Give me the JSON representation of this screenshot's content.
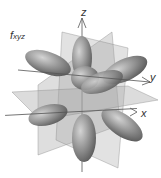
{
  "diagram": {
    "orbital_label": "f",
    "orbital_subscript": "xyz",
    "axes": {
      "x": "x",
      "y": "y",
      "z": "z"
    },
    "colors": {
      "lobe": "#8c8c8c",
      "lobe_highlight": "#c8c8c8",
      "plane": "#9a9a9a",
      "axis": "#555555"
    }
  }
}
